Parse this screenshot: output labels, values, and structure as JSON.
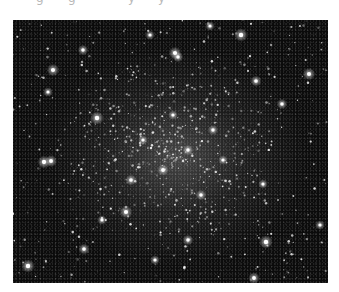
{
  "image": {
    "subject": "globular star cluster",
    "description": "Dense field of white stars on a black sky, concentrated toward the center",
    "frame": {
      "x": 13,
      "y": 20,
      "width": 315,
      "height": 263
    },
    "colors": {
      "sky": "#0b0b0b",
      "star": "#ffffff",
      "page": "#ffffff"
    }
  },
  "caption_remnant": {
    "note": "top text cut off; only descenders visible",
    "fragments": [
      "g",
      "g",
      "y",
      "y"
    ]
  },
  "bright_stars": [
    {
      "x": 40,
      "y": 50,
      "r": 2.6
    },
    {
      "x": 70,
      "y": 30,
      "r": 2.2
    },
    {
      "x": 84,
      "y": 98,
      "r": 2.8
    },
    {
      "x": 35,
      "y": 72,
      "r": 2.0
    },
    {
      "x": 228,
      "y": 15,
      "r": 2.8
    },
    {
      "x": 296,
      "y": 54,
      "r": 2.6
    },
    {
      "x": 243,
      "y": 61,
      "r": 2.3
    },
    {
      "x": 269,
      "y": 84,
      "r": 2.2
    },
    {
      "x": 15,
      "y": 246,
      "r": 2.8
    },
    {
      "x": 71,
      "y": 229,
      "r": 2.3
    },
    {
      "x": 113,
      "y": 192,
      "r": 2.6
    },
    {
      "x": 89,
      "y": 200,
      "r": 2.0
    },
    {
      "x": 253,
      "y": 222,
      "r": 2.8
    },
    {
      "x": 241,
      "y": 258,
      "r": 2.4
    },
    {
      "x": 250,
      "y": 164,
      "r": 2.0
    },
    {
      "x": 307,
      "y": 205,
      "r": 2.0
    },
    {
      "x": 31,
      "y": 142,
      "r": 2.7
    },
    {
      "x": 38,
      "y": 141,
      "r": 2.5
    },
    {
      "x": 162,
      "y": 33,
      "r": 2.6
    },
    {
      "x": 165,
      "y": 37,
      "r": 2.2
    },
    {
      "x": 137,
      "y": 15,
      "r": 2.0
    },
    {
      "x": 197,
      "y": 6,
      "r": 2.0
    },
    {
      "x": 150,
      "y": 150,
      "r": 2.4
    },
    {
      "x": 175,
      "y": 130,
      "r": 2.2
    },
    {
      "x": 130,
      "y": 120,
      "r": 2.0
    },
    {
      "x": 200,
      "y": 110,
      "r": 2.1
    },
    {
      "x": 160,
      "y": 95,
      "r": 2.0
    },
    {
      "x": 118,
      "y": 160,
      "r": 2.3
    },
    {
      "x": 188,
      "y": 175,
      "r": 2.2
    },
    {
      "x": 210,
      "y": 140,
      "r": 2.0
    },
    {
      "x": 142,
      "y": 240,
      "r": 2.0
    },
    {
      "x": 175,
      "y": 220,
      "r": 2.2
    }
  ],
  "faint_star_field": {
    "count": 900,
    "seed": 7,
    "center": [
      155,
      130
    ],
    "spread": 95
  }
}
